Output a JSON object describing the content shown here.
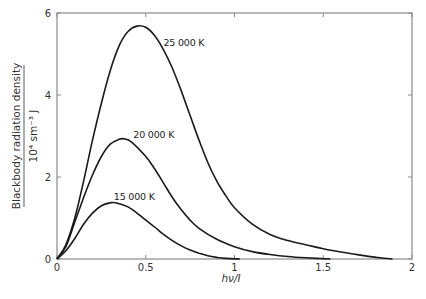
{
  "chart_data": {
    "type": "line",
    "title": "",
    "xlabel": "hν/I",
    "ylabel": "Blackbody radiation density",
    "ylabel_units": "10⁴ sm⁻³ J",
    "xlim": [
      0,
      2
    ],
    "ylim": [
      0,
      6
    ],
    "grid": false,
    "legend": "inline labels",
    "x_ticks": [
      "0",
      "0.5",
      "1",
      "1.5",
      "2"
    ],
    "y_ticks": [
      "0",
      "2",
      "4",
      "6"
    ],
    "series": [
      {
        "name": "25 000 K",
        "label": "25 000 K",
        "points": [
          [
            0,
            0
          ],
          [
            0.05,
            0.35
          ],
          [
            0.1,
            1.0
          ],
          [
            0.15,
            1.9
          ],
          [
            0.2,
            2.9
          ],
          [
            0.25,
            3.8
          ],
          [
            0.3,
            4.6
          ],
          [
            0.35,
            5.2
          ],
          [
            0.4,
            5.55
          ],
          [
            0.45,
            5.68
          ],
          [
            0.5,
            5.65
          ],
          [
            0.55,
            5.45
          ],
          [
            0.6,
            5.1
          ],
          [
            0.65,
            4.65
          ],
          [
            0.7,
            4.1
          ],
          [
            0.75,
            3.5
          ],
          [
            0.8,
            2.9
          ],
          [
            0.85,
            2.35
          ],
          [
            0.9,
            1.9
          ],
          [
            0.95,
            1.55
          ],
          [
            1.0,
            1.25
          ],
          [
            1.1,
            0.85
          ],
          [
            1.2,
            0.6
          ],
          [
            1.3,
            0.45
          ],
          [
            1.4,
            0.35
          ],
          [
            1.5,
            0.25
          ],
          [
            1.6,
            0.17
          ],
          [
            1.7,
            0.1
          ],
          [
            1.8,
            0.04
          ],
          [
            1.89,
            0
          ]
        ]
      },
      {
        "name": "20 000 K",
        "label": "20 000 K",
        "points": [
          [
            0,
            0
          ],
          [
            0.05,
            0.3
          ],
          [
            0.1,
            0.9
          ],
          [
            0.15,
            1.5
          ],
          [
            0.2,
            2.05
          ],
          [
            0.25,
            2.5
          ],
          [
            0.3,
            2.8
          ],
          [
            0.35,
            2.92
          ],
          [
            0.38,
            2.93
          ],
          [
            0.42,
            2.85
          ],
          [
            0.5,
            2.5
          ],
          [
            0.55,
            2.2
          ],
          [
            0.6,
            1.85
          ],
          [
            0.65,
            1.5
          ],
          [
            0.7,
            1.2
          ],
          [
            0.75,
            0.95
          ],
          [
            0.8,
            0.75
          ],
          [
            0.9,
            0.48
          ],
          [
            1.0,
            0.3
          ],
          [
            1.1,
            0.18
          ],
          [
            1.2,
            0.11
          ],
          [
            1.3,
            0.06
          ],
          [
            1.4,
            0.03
          ],
          [
            1.54,
            0
          ]
        ]
      },
      {
        "name": "15 000 K",
        "label": "15 000 K",
        "points": [
          [
            0,
            0
          ],
          [
            0.05,
            0.2
          ],
          [
            0.1,
            0.5
          ],
          [
            0.15,
            0.85
          ],
          [
            0.2,
            1.12
          ],
          [
            0.25,
            1.3
          ],
          [
            0.3,
            1.37
          ],
          [
            0.33,
            1.37
          ],
          [
            0.4,
            1.27
          ],
          [
            0.45,
            1.12
          ],
          [
            0.5,
            0.95
          ],
          [
            0.55,
            0.78
          ],
          [
            0.6,
            0.6
          ],
          [
            0.65,
            0.45
          ],
          [
            0.7,
            0.32
          ],
          [
            0.75,
            0.22
          ],
          [
            0.8,
            0.14
          ],
          [
            0.85,
            0.08
          ],
          [
            0.9,
            0.04
          ],
          [
            0.95,
            0.015
          ],
          [
            1.03,
            0
          ]
        ]
      }
    ],
    "annotations": [
      {
        "text": "25 000 K",
        "x": 0.6,
        "y": 5.2
      },
      {
        "text": "20 000 K",
        "x": 0.43,
        "y": 2.95
      },
      {
        "text": "15 000 K",
        "x": 0.32,
        "y": 1.45
      }
    ]
  }
}
